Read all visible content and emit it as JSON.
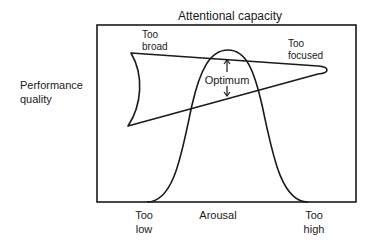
{
  "title": "Attentional capacity",
  "y_axis": {
    "label_line1": "Performance",
    "label_line2": "quality"
  },
  "x_axis": {
    "label": "Arousal",
    "left": {
      "line1": "Too",
      "line2": "low"
    },
    "right": {
      "line1": "Too",
      "line2": "high"
    }
  },
  "annotations": {
    "too_broad": {
      "line1": "Too",
      "line2": "broad"
    },
    "too_focused": {
      "line1": "Too",
      "line2": "focused"
    },
    "optimum": "Optimum"
  },
  "colors": {
    "stroke": "#1a1a1a",
    "background": "#ffffff"
  }
}
